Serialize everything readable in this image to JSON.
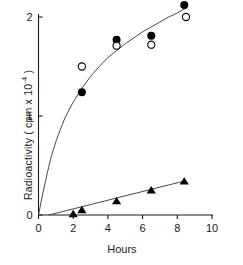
{
  "chart_data": {
    "type": "scatter",
    "title": "",
    "xlabel": "Hours",
    "ylabel": "Radioactivity ( cpm x 10",
    "ylabel_exponent": "-4",
    "ylabel_tail": " )",
    "xlim": [
      0,
      10
    ],
    "ylim": [
      0,
      2.2
    ],
    "xticks": [
      0,
      2,
      4,
      6,
      8,
      10
    ],
    "xticklabels": [
      "0",
      "2",
      "4",
      "6",
      "8",
      "10"
    ],
    "yticks": [
      0,
      1,
      2
    ],
    "yticklabels": [
      "0",
      "1",
      "2"
    ],
    "grid": false,
    "legend": "none",
    "series": [
      {
        "name": "filled-circle-series",
        "marker": "filled-circle",
        "color": "#000000",
        "x": [
          2.5,
          4.5,
          6.5,
          8.4
        ],
        "values": [
          1.24,
          1.77,
          1.81,
          2.12
        ]
      },
      {
        "name": "open-circle-series",
        "marker": "open-circle",
        "color": "#000000",
        "x": [
          2.5,
          4.5,
          6.5,
          8.5
        ],
        "values": [
          1.5,
          1.71,
          1.72,
          2.0
        ]
      },
      {
        "name": "filled-triangle-series",
        "marker": "filled-triangle",
        "color": "#000000",
        "x": [
          2.0,
          2.5,
          4.5,
          6.5,
          8.4
        ],
        "values": [
          0.01,
          0.05,
          0.14,
          0.25,
          0.34
        ]
      }
    ],
    "fitted_curves": [
      {
        "name": "saturating-curve",
        "through_series": "circles",
        "description": "rising saturating curve from origin through circle data",
        "points": [
          [
            0.0,
            0.0
          ],
          [
            0.25,
            0.22
          ],
          [
            0.5,
            0.42
          ],
          [
            0.75,
            0.6
          ],
          [
            1.0,
            0.74
          ],
          [
            1.25,
            0.86
          ],
          [
            1.5,
            0.97
          ],
          [
            1.75,
            1.06
          ],
          [
            2.0,
            1.14
          ],
          [
            2.5,
            1.28
          ],
          [
            3.0,
            1.4
          ],
          [
            3.5,
            1.5
          ],
          [
            4.0,
            1.59
          ],
          [
            4.5,
            1.66
          ],
          [
            5.0,
            1.73
          ],
          [
            5.5,
            1.79
          ],
          [
            6.0,
            1.85
          ],
          [
            6.5,
            1.9
          ],
          [
            7.0,
            1.95
          ],
          [
            7.5,
            2.0
          ],
          [
            8.0,
            2.04
          ],
          [
            8.5,
            2.09
          ]
        ]
      },
      {
        "name": "linear-line",
        "through_series": "triangles",
        "description": "near-linear line from origin through triangle data",
        "points": [
          [
            0.6,
            0.0
          ],
          [
            8.45,
            0.345
          ]
        ]
      }
    ]
  },
  "axes": {
    "x_axis_name": "hours-axis",
    "y_axis_name": "radioactivity-axis"
  }
}
